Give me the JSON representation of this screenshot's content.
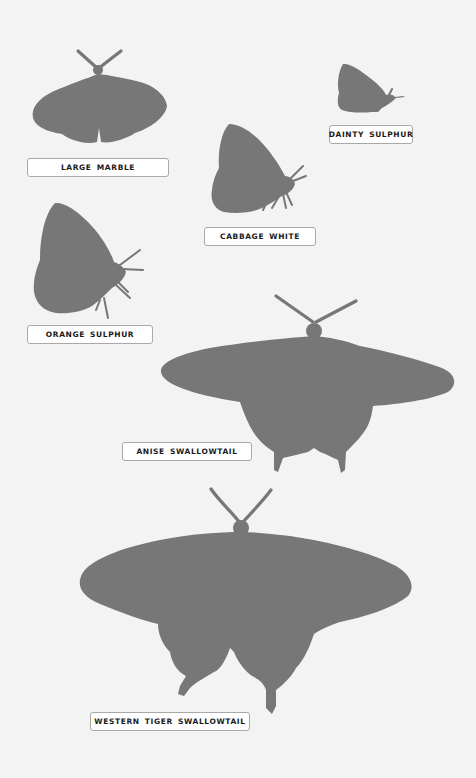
{
  "butterflies": [
    {
      "id": "large-marble",
      "label": "LARGE MARBLE"
    },
    {
      "id": "dainty-sulphur",
      "label": "DAINTY SULPHUR"
    },
    {
      "id": "cabbage-white",
      "label": "CABBAGE WHITE"
    },
    {
      "id": "orange-sulphur",
      "label": "ORANGE SULPHUR"
    },
    {
      "id": "anise-swallowtail",
      "label": "ANISE SWALLOWTAIL"
    },
    {
      "id": "western-tiger-swallowtail",
      "label": "WESTERN TIGER SWALLOWTAIL"
    }
  ],
  "colors": {
    "background": "#f3f3f3",
    "silhouette": "#777777",
    "label_background": "#ffffff",
    "label_border": "#a9a9a9",
    "label_text": "#1a1a1a"
  }
}
